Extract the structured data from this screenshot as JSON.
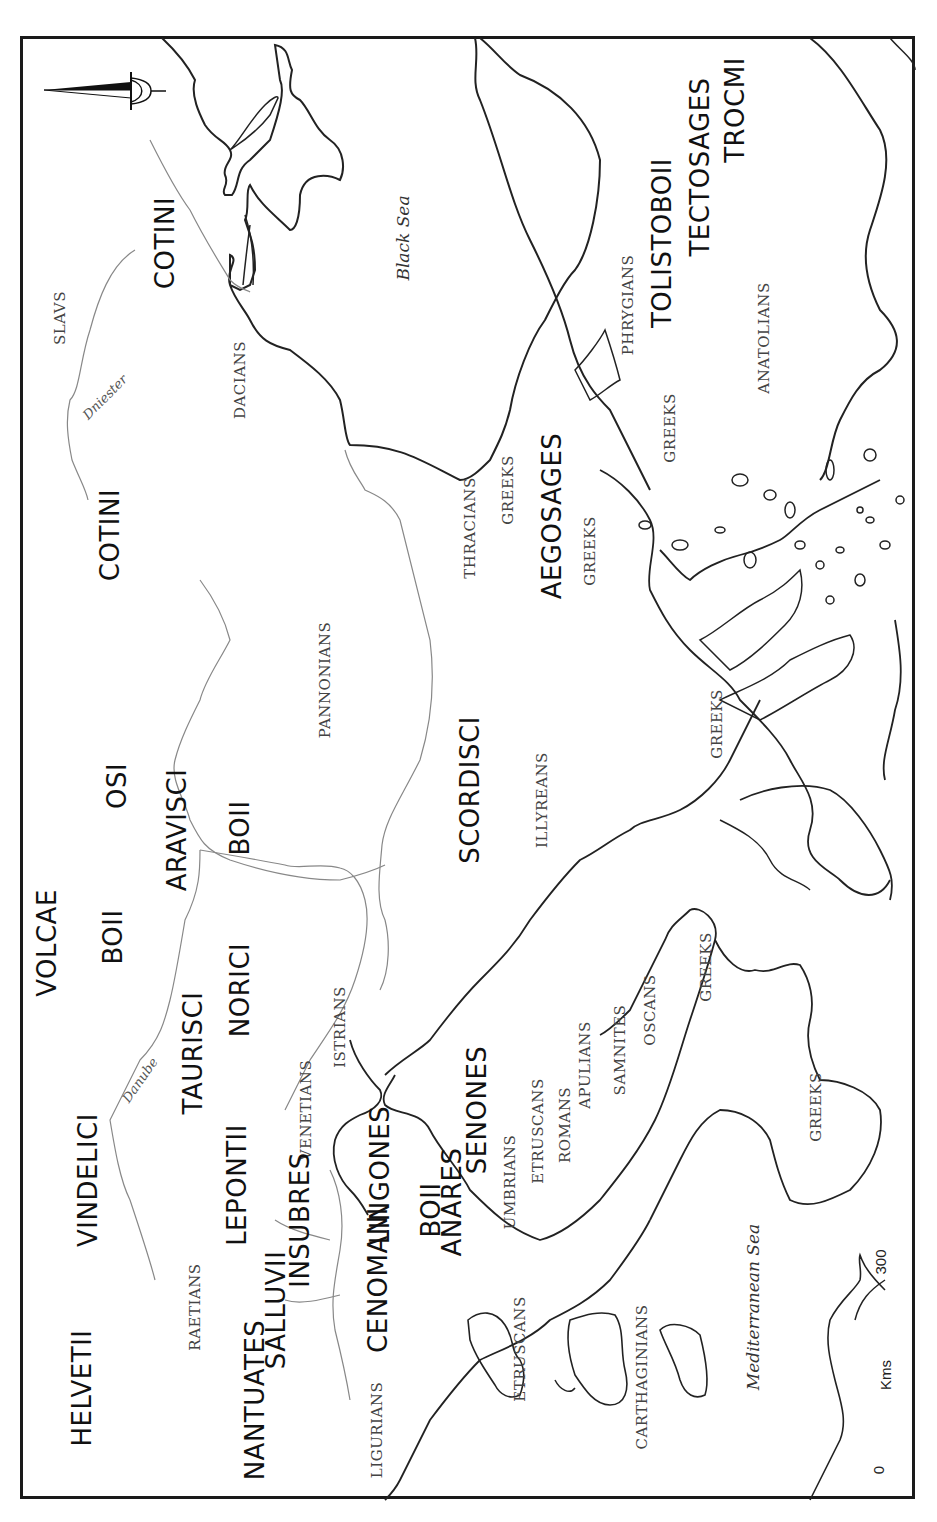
{
  "map": {
    "orientation": "rotated 90° counter-clockwise (north points left)",
    "compass": {
      "label": "N"
    },
    "scale_bar": {
      "start": "0",
      "end": "300",
      "unit": "Kms"
    },
    "seas": [
      {
        "name": "Black Sea"
      },
      {
        "name": "Mediterranean Sea"
      }
    ],
    "rivers": [
      {
        "name": "Dniester"
      },
      {
        "name": "Danube"
      }
    ],
    "celtic_tribes": [
      "COTINI",
      "COTINI",
      "TOLISTOBOII",
      "TECTOSAGES",
      "TROCMI",
      "AEGOSAGES",
      "OSI",
      "ARAVISCI",
      "BOII",
      "SCORDISCI",
      "VOLCAE",
      "BOII",
      "NORICI",
      "TAURISCI",
      "VINDELICI",
      "LEPONTII",
      "HELVETII",
      "NANTUATES",
      "SALLUVII",
      "INSUBRES",
      "CENOMANI",
      "LINGONES",
      "BOII",
      "ANARES",
      "SENONES"
    ],
    "other_peoples": [
      "SLAVS",
      "DACIANS",
      "PANNONIANS",
      "THRACIANS",
      "GREEKS",
      "GREEKS",
      "PHRYGIANS",
      "GREEKS",
      "ANATOLIANS",
      "GREEKS",
      "ILLYREANS",
      "ISTRIANS",
      "VENETIANS",
      "RAETIANS",
      "LIGURIANS",
      "UMBRIANS",
      "ETRUSCANS",
      "ROMANS",
      "APULIANS",
      "SAMNITES",
      "OSCANS",
      "GREEKS",
      "GREEKS",
      "ETRUSCANS",
      "CARTHAGINIANS"
    ]
  },
  "labels": {
    "slavs": "SLAVS",
    "cotini_1": "COTINI",
    "dniester": "Dniester",
    "dacians": "DACIANS",
    "black_sea": "Black Sea",
    "phrygians": "PHRYGIANS",
    "tolistoboii": "TOLISTOBOII",
    "tectosages": "TECTOSAGES",
    "trocmi": "TROCMI",
    "anatolians": "ANATOLIANS",
    "greeks_asia": "GREEKS",
    "cotini_2": "COTINI",
    "pannonians": "PANNONIANS",
    "thracians": "THRACIANS",
    "greeks_thrace": "GREEKS",
    "aegosages": "AEGOSAGES",
    "greeks_aegean": "GREEKS",
    "osi": "OSI",
    "aravisci": "ARAVISCI",
    "boii_pannonia": "BOII",
    "scordisci": "SCORDISCI",
    "illyreans": "ILLYREANS",
    "greeks_greece": "GREEKS",
    "volcae": "VOLCAE",
    "boii_bohemia": "BOII",
    "norici": "NORICI",
    "taurisci": "TAURISCI",
    "danube": "Danube",
    "istrians": "ISTRIANS",
    "vindelici": "VINDELICI",
    "lepontii": "LEPONTII",
    "venetians": "VENETIANS",
    "lingones": "LINGONES",
    "senones": "SENONES",
    "umbrians": "UMBRIANS",
    "etruscans_italy": "ETRUSCANS",
    "romans": "ROMANS",
    "apulians": "APULIANS",
    "samnites": "SAMNITES",
    "oscans": "OSCANS",
    "greeks_italy_1": "GREEKS",
    "greeks_italy_2": "GREEKS",
    "helvetii": "HELVETII",
    "raetians": "RAETIANS",
    "insubres": "INSUBRES",
    "nantuates": "NANTUATES",
    "salluvii": "SALLUVII",
    "cenomani": "CENOMANI",
    "boii_italy": "BOII",
    "anares": "ANARES",
    "ligurians": "LIGURIANS",
    "etruscans_corsica": "ETRUSCANS",
    "carthaginians": "CARTHAGINIANS",
    "mediterranean_sea": "Mediterranean Sea",
    "scale_zero": "0",
    "scale_unit": "Kms",
    "scale_max": "300",
    "compass_n": "N"
  }
}
